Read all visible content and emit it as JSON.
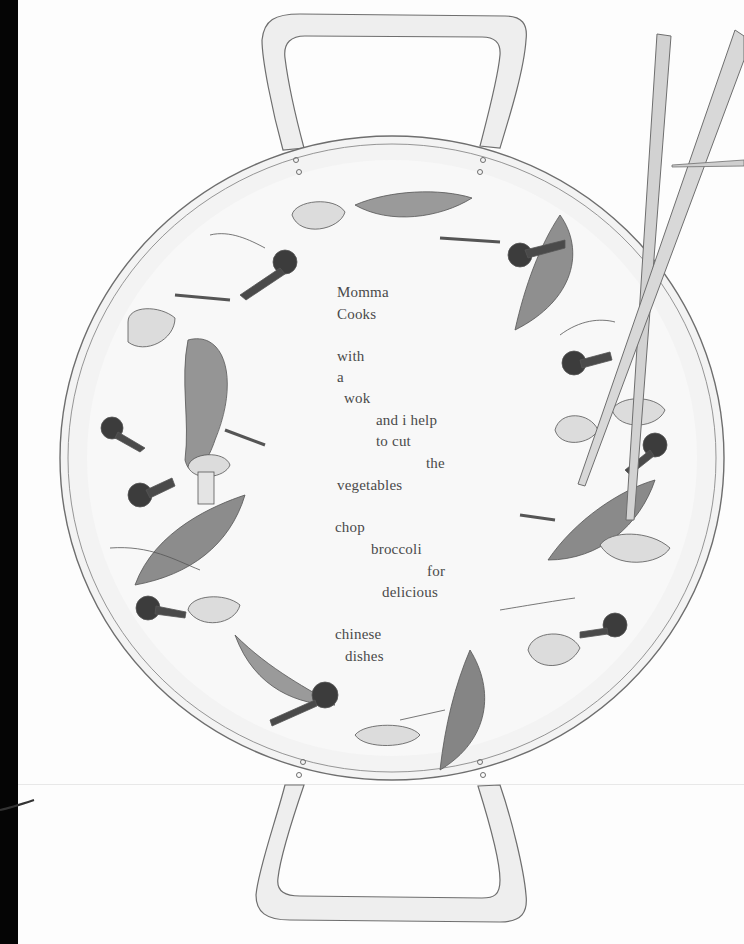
{
  "page": {
    "type": "illustrated book page",
    "illustration": "wok with handles, chopsticks and stir-fry vegetables (snow peas, broccoli, mushrooms, bean sprouts)"
  },
  "poem": {
    "stanzas": [
      {
        "lines": [
          {
            "text": "Momma",
            "x": 337,
            "y": 284
          },
          {
            "text": "Cooks",
            "x": 337,
            "y": 306
          }
        ]
      },
      {
        "lines": [
          {
            "text": "with",
            "x": 337,
            "y": 348
          },
          {
            "text": "a",
            "x": 337,
            "y": 369
          },
          {
            "text": "wok",
            "x": 344,
            "y": 390
          },
          {
            "text": "and i help",
            "x": 376,
            "y": 412
          },
          {
            "text": "to cut",
            "x": 376,
            "y": 433
          },
          {
            "text": "the",
            "x": 426,
            "y": 455
          },
          {
            "text": "vegetables",
            "x": 337,
            "y": 477
          }
        ]
      },
      {
        "lines": [
          {
            "text": "chop",
            "x": 335,
            "y": 519
          },
          {
            "text": "broccoli",
            "x": 371,
            "y": 541
          },
          {
            "text": "for",
            "x": 427,
            "y": 563
          },
          {
            "text": "delicious",
            "x": 382,
            "y": 584
          }
        ]
      },
      {
        "lines": [
          {
            "text": "chinese",
            "x": 335,
            "y": 626
          },
          {
            "text": "dishes",
            "x": 345,
            "y": 648
          }
        ]
      }
    ]
  },
  "colors": {
    "ink": "#4a4a4a",
    "outline": "#6e6e6e",
    "wok_fill": "#f3f3f3",
    "handle_fill": "#eeeeee",
    "pea": "#8f8f8f",
    "broccoli": "#3c3c3c",
    "mushroom": "#dcdcdc",
    "chopstick": "#d2d2d2"
  }
}
